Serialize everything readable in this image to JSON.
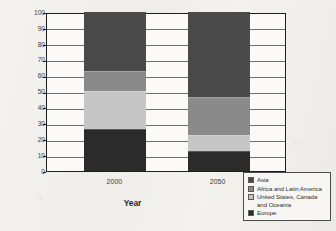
{
  "chart_data": {
    "type": "bar",
    "subtype": "stacked-bar",
    "title": "",
    "xlabel": "Year",
    "ylabel": "Percent of global economic activity",
    "categories": [
      "2000",
      "2050"
    ],
    "ylim": [
      0,
      100
    ],
    "yticks": [
      0,
      10,
      20,
      30,
      40,
      50,
      60,
      70,
      80,
      90,
      100
    ],
    "ytick_labels": [
      "0",
      "10",
      "20",
      "30",
      "40",
      "50",
      "60",
      "70",
      "80",
      "90",
      "100"
    ],
    "grid": true,
    "grid_axis": "y",
    "legend_position": "bottom-right-outside",
    "stack_order_bottom_to_top": [
      "Europe",
      "United States, Canada and Oceania",
      "Africa and Latin America",
      "Asia"
    ],
    "series": [
      {
        "name": "Asia",
        "color": "#4a4a4a",
        "values": [
          38,
          54
        ],
        "cumulative_top": [
          100,
          100
        ],
        "cumulative_bottom": [
          62,
          46
        ]
      },
      {
        "name": "Africa and Latin America",
        "color": "#8a8a8a",
        "values": [
          12,
          24
        ],
        "cumulative_top": [
          62,
          46
        ],
        "cumulative_bottom": [
          50,
          22
        ]
      },
      {
        "name": "United States, Canada and Oceania",
        "color": "#c6c6c6",
        "values": [
          24,
          10
        ],
        "cumulative_top": [
          50,
          22
        ],
        "cumulative_bottom": [
          26,
          12
        ]
      },
      {
        "name": "Europe",
        "color": "#2b2b2b",
        "values": [
          26,
          12
        ],
        "cumulative_top": [
          26,
          12
        ],
        "cumulative_bottom": [
          0,
          0
        ]
      }
    ]
  },
  "legend": {
    "entries": [
      {
        "label": "Asia",
        "color": "#4a4a4a"
      },
      {
        "label": "Africa and Latin America",
        "color": "#8a8a8a"
      },
      {
        "label": "United States, Canada and Oceania",
        "color": "#c6c6c6"
      },
      {
        "label": "Europe",
        "color": "#2b2b2b"
      }
    ]
  }
}
